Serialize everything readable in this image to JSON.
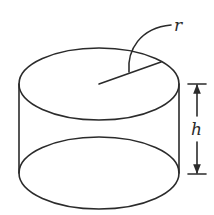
{
  "figure": {
    "colors": {
      "line": "#2b2b2b",
      "background": "#ffffff"
    },
    "labels": {
      "radius": "r",
      "height": "h"
    },
    "geometry": {
      "top_ellipse": {
        "cx": 99,
        "cy": 84,
        "rx": 80,
        "ry": 36
      },
      "bottom_ellipse": {
        "cx": 99,
        "cy": 173,
        "rx": 80,
        "ry": 36
      }
    }
  }
}
